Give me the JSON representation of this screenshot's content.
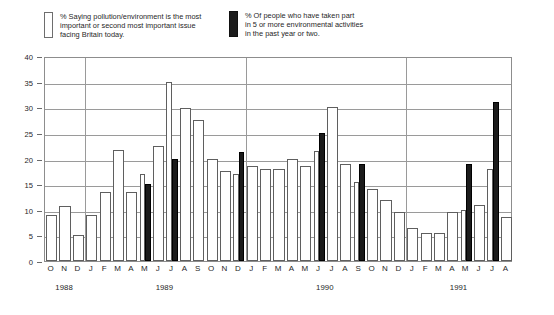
{
  "legend": {
    "entries": [
      {
        "swatch": "open",
        "label": "% Saying pollution/environment is the most\nimportant or second most important issue\nfacing Britain today."
      },
      {
        "swatch": "filled",
        "label": "% Of people who have taken part\nin 5 or more environmental activities\nin the past year or two."
      }
    ]
  },
  "chart_data": {
    "type": "bar",
    "title": "",
    "subtitle": "",
    "xlabel": "",
    "ylabel": "",
    "ylim": [
      0,
      40
    ],
    "yticks": [
      0,
      5,
      10,
      15,
      20,
      25,
      30,
      35,
      40
    ],
    "grid": true,
    "legend_position": "top",
    "categories": [
      "O",
      "N",
      "D",
      "J",
      "F",
      "M",
      "A",
      "M",
      "J",
      "J",
      "A",
      "S",
      "O",
      "N",
      "D",
      "J",
      "F",
      "M",
      "A",
      "M",
      "J",
      "J",
      "A",
      "S",
      "O",
      "N",
      "D",
      "J",
      "F",
      "M",
      "A",
      "M",
      "J",
      "J",
      "A"
    ],
    "year_groups": [
      {
        "label": "1988",
        "start_index": 0,
        "end_index": 2
      },
      {
        "label": "1989",
        "start_index": 3,
        "end_index": 14
      },
      {
        "label": "1990",
        "start_index": 15,
        "end_index": 26
      },
      {
        "label": "1991",
        "start_index": 27,
        "end_index": 34
      }
    ],
    "year_boundaries_after_index": [
      2,
      14,
      26
    ],
    "series": [
      {
        "name": "% Saying pollution/environment is the most important or second most important issue facing Britain today.",
        "style": "open",
        "color": "#ffffff",
        "values": [
          9,
          10.7,
          5,
          9,
          13.5,
          21.7,
          13.5,
          17,
          22.5,
          35,
          29.8,
          27.5,
          20,
          17.5,
          17,
          18.5,
          18,
          18,
          20,
          18.5,
          21.5,
          30,
          19,
          15.5,
          14,
          12,
          9.5,
          6.5,
          5.5,
          5.5,
          9.5,
          10,
          11,
          18,
          8.5
        ]
      },
      {
        "name": "% Of people who have taken part in 5 or more environmental activities in the past year or two.",
        "style": "filled",
        "color": "#1c1c1c",
        "values": [
          null,
          null,
          null,
          null,
          null,
          null,
          null,
          15,
          null,
          20,
          null,
          null,
          null,
          null,
          21.2,
          null,
          null,
          null,
          null,
          null,
          25,
          null,
          null,
          19,
          null,
          null,
          null,
          null,
          null,
          null,
          null,
          19,
          null,
          31,
          null
        ]
      }
    ]
  }
}
